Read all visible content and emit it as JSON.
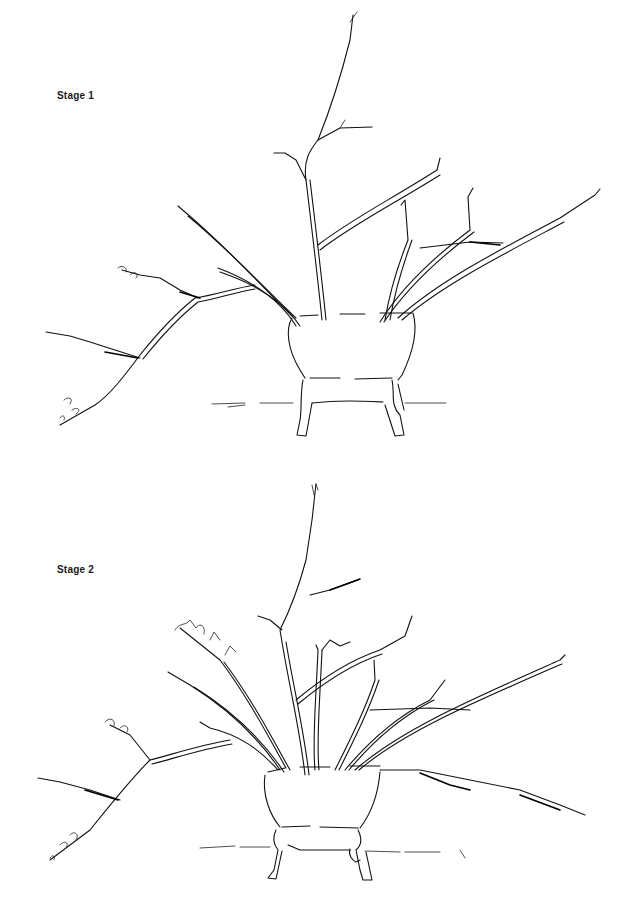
{
  "stages": [
    {
      "label": "Stage 1"
    },
    {
      "label": "Stage 2"
    }
  ]
}
